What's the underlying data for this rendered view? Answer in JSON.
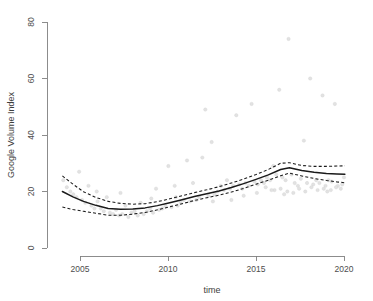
{
  "chart_data": {
    "type": "scatter",
    "title": "",
    "xlabel": "time",
    "ylabel": "Google Volume Index",
    "xlim": [
      2003.8,
      2020.3
    ],
    "ylim": [
      0,
      80
    ],
    "grid": false,
    "legend": "none",
    "xticks": [
      2005,
      2010,
      2015,
      2020
    ],
    "xticklabels": [
      "2005",
      "2010",
      "2015",
      "2020"
    ],
    "yticks": [
      0,
      20,
      40,
      60,
      80
    ],
    "yticklabels": [
      "0",
      "20",
      "40",
      "60",
      "80"
    ],
    "series": [
      {
        "name": "Google Volume Index observations",
        "type": "scatter",
        "marker": "open-circle",
        "color": "#e2e2e2",
        "points": [
          [
            2004.05,
            24.0
          ],
          [
            2004.25,
            21.5
          ],
          [
            2004.45,
            20.0
          ],
          [
            2004.62,
            19.0
          ],
          [
            2004.8,
            18.0
          ],
          [
            2004.95,
            27.0
          ],
          [
            2005.12,
            17.0
          ],
          [
            2005.3,
            16.0
          ],
          [
            2005.48,
            22.0
          ],
          [
            2005.65,
            15.0
          ],
          [
            2005.82,
            14.0
          ],
          [
            2006.0,
            16.5
          ],
          [
            2006.18,
            14.0
          ],
          [
            2006.35,
            13.0
          ],
          [
            2006.52,
            18.0
          ],
          [
            2006.7,
            12.5
          ],
          [
            2006.88,
            12.0
          ],
          [
            2007.05,
            13.5
          ],
          [
            2007.22,
            11.5
          ],
          [
            2007.4,
            12.0
          ],
          [
            2007.58,
            15.0
          ],
          [
            2007.75,
            11.0
          ],
          [
            2007.92,
            12.5
          ],
          [
            2008.1,
            13.0
          ],
          [
            2008.28,
            11.5
          ],
          [
            2008.45,
            16.0
          ],
          [
            2008.62,
            12.0
          ],
          [
            2008.8,
            13.0
          ],
          [
            2008.98,
            14.0
          ],
          [
            2009.15,
            12.5
          ],
          [
            2009.32,
            21.0
          ],
          [
            2009.5,
            13.5
          ],
          [
            2009.68,
            14.0
          ],
          [
            2009.85,
            15.0
          ],
          [
            2010.02,
            29.0
          ],
          [
            2010.2,
            14.5
          ],
          [
            2010.38,
            22.0
          ],
          [
            2010.55,
            15.0
          ],
          [
            2010.72,
            16.0
          ],
          [
            2010.9,
            17.0
          ],
          [
            2011.08,
            31.0
          ],
          [
            2011.25,
            16.5
          ],
          [
            2011.42,
            23.0
          ],
          [
            2011.6,
            17.0
          ],
          [
            2011.78,
            18.0
          ],
          [
            2011.95,
            32.0
          ],
          [
            2012.12,
            49.0
          ],
          [
            2012.3,
            18.5
          ],
          [
            2012.48,
            37.5
          ],
          [
            2012.65,
            19.0
          ],
          [
            2012.82,
            20.0
          ],
          [
            2013.0,
            22.0
          ],
          [
            2013.18,
            20.5
          ],
          [
            2013.35,
            24.0
          ],
          [
            2013.52,
            21.0
          ],
          [
            2013.7,
            22.0
          ],
          [
            2013.88,
            47.0
          ],
          [
            2014.05,
            22.5
          ],
          [
            2014.22,
            21.0
          ],
          [
            2014.4,
            23.0
          ],
          [
            2014.58,
            22.0
          ],
          [
            2014.75,
            51.0
          ],
          [
            2014.92,
            23.5
          ],
          [
            2015.1,
            22.5
          ],
          [
            2015.28,
            24.0
          ],
          [
            2015.45,
            23.0
          ],
          [
            2015.62,
            25.0
          ],
          [
            2015.8,
            24.0
          ],
          [
            2015.98,
            29.0
          ],
          [
            2016.15,
            26.0
          ],
          [
            2016.32,
            56.0
          ],
          [
            2016.5,
            25.0
          ],
          [
            2016.68,
            24.0
          ],
          [
            2016.85,
            74.0
          ],
          [
            2017.02,
            26.0
          ],
          [
            2017.2,
            23.0
          ],
          [
            2017.38,
            22.0
          ],
          [
            2017.55,
            24.5
          ],
          [
            2017.72,
            38.0
          ],
          [
            2017.9,
            23.0
          ],
          [
            2018.08,
            60.0
          ],
          [
            2018.25,
            22.5
          ],
          [
            2018.42,
            24.0
          ],
          [
            2018.6,
            23.0
          ],
          [
            2018.78,
            54.0
          ],
          [
            2018.95,
            22.0
          ],
          [
            2019.12,
            24.0
          ],
          [
            2019.3,
            23.5
          ],
          [
            2019.48,
            51.0
          ],
          [
            2019.65,
            22.0
          ],
          [
            2019.82,
            21.0
          ],
          [
            2020.0,
            25.0
          ],
          [
            2005.95,
            20.0
          ],
          [
            2007.3,
            19.5
          ],
          [
            2009.05,
            17.5
          ],
          [
            2010.45,
            18.0
          ],
          [
            2012.55,
            16.5
          ],
          [
            2013.6,
            17.0
          ],
          [
            2014.3,
            18.5
          ],
          [
            2015.05,
            19.5
          ],
          [
            2016.05,
            20.5
          ],
          [
            2016.6,
            19.0
          ],
          [
            2017.12,
            19.5
          ],
          [
            2017.8,
            20.0
          ],
          [
            2018.5,
            20.5
          ],
          [
            2019.05,
            20.0
          ],
          [
            2019.55,
            21.5
          ],
          [
            2019.9,
            22.5
          ],
          [
            2016.4,
            21.0
          ],
          [
            2016.78,
            20.0
          ],
          [
            2017.45,
            21.0
          ],
          [
            2018.15,
            21.5
          ],
          [
            2018.85,
            21.0
          ],
          [
            2019.25,
            20.5
          ],
          [
            2015.55,
            21.5
          ],
          [
            2015.88,
            20.5
          ]
        ]
      },
      {
        "name": "fitted trend",
        "type": "line",
        "style": "solid",
        "color": "#1a1a1a",
        "x": [
          2004.0,
          2004.6,
          2005.2,
          2005.9,
          2006.6,
          2007.3,
          2008.0,
          2008.7,
          2009.4,
          2010.1,
          2010.8,
          2011.5,
          2012.2,
          2012.9,
          2013.6,
          2014.3,
          2015.0,
          2015.7,
          2016.4,
          2016.9,
          2017.6,
          2018.3,
          2019.0,
          2019.6,
          2020.05
        ],
        "y": [
          20.0,
          18.1,
          16.5,
          15.1,
          14.0,
          13.7,
          13.8,
          14.2,
          15.0,
          16.0,
          17.1,
          18.2,
          19.2,
          20.2,
          21.4,
          22.8,
          24.3,
          25.9,
          27.8,
          28.4,
          27.4,
          26.8,
          26.4,
          26.2,
          26.1
        ]
      },
      {
        "name": "upper confidence band",
        "type": "line",
        "style": "dashed",
        "color": "#1a1a1a",
        "x": [
          2004.0,
          2004.6,
          2005.2,
          2005.9,
          2006.6,
          2007.3,
          2008.0,
          2008.7,
          2009.4,
          2010.1,
          2010.8,
          2011.5,
          2012.2,
          2012.9,
          2013.6,
          2014.3,
          2015.0,
          2015.7,
          2016.4,
          2016.9,
          2017.6,
          2018.3,
          2019.0,
          2019.6,
          2020.05
        ],
        "y": [
          25.5,
          22.6,
          19.9,
          17.9,
          16.5,
          15.8,
          15.5,
          15.7,
          16.4,
          17.4,
          18.5,
          19.6,
          20.6,
          21.7,
          23.0,
          24.4,
          26.0,
          27.8,
          30.0,
          30.2,
          29.2,
          28.9,
          28.9,
          29.0,
          29.1
        ]
      },
      {
        "name": "lower confidence band",
        "type": "line",
        "style": "dashed",
        "color": "#1a1a1a",
        "x": [
          2004.0,
          2004.6,
          2005.2,
          2005.9,
          2006.6,
          2007.3,
          2008.0,
          2008.7,
          2009.4,
          2010.1,
          2010.8,
          2011.5,
          2012.2,
          2012.9,
          2013.6,
          2014.3,
          2015.0,
          2015.7,
          2016.4,
          2016.9,
          2017.6,
          2018.3,
          2019.0,
          2019.6,
          2020.05
        ],
        "y": [
          14.5,
          13.6,
          13.0,
          12.3,
          11.6,
          11.6,
          12.0,
          12.6,
          13.5,
          14.6,
          15.7,
          16.8,
          17.8,
          18.7,
          19.8,
          21.1,
          22.6,
          24.0,
          25.6,
          26.5,
          25.5,
          24.6,
          23.9,
          23.4,
          23.1
        ]
      }
    ]
  },
  "colors": {
    "background": "#ffffff",
    "axis": "#808080",
    "tick_text": "#4d4d4d",
    "fit": "#1a1a1a",
    "points": "#e2e2e2"
  }
}
